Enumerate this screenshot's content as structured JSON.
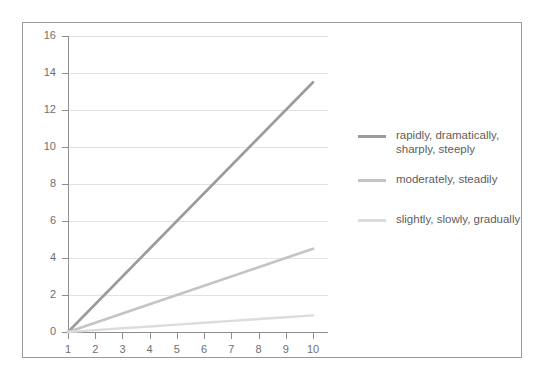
{
  "chart_data": {
    "type": "line",
    "title": "",
    "xlabel": "",
    "ylabel": "",
    "x": [
      1,
      2,
      3,
      4,
      5,
      6,
      7,
      8,
      9,
      10
    ],
    "xlim": [
      1,
      10
    ],
    "ylim": [
      0,
      16
    ],
    "ytick_labels": [
      "0",
      "2",
      "4",
      "6",
      "8",
      "10",
      "12",
      "14",
      "16"
    ],
    "yticks": [
      0,
      2,
      4,
      6,
      8,
      10,
      12,
      14,
      16
    ],
    "xtick_labels": [
      "1",
      "2",
      "3",
      "4",
      "5",
      "6",
      "7",
      "8",
      "9",
      "10"
    ],
    "grid": "horizontal",
    "legend_position": "right",
    "series": [
      {
        "name": "rapidly, dramatically, sharply, steeply",
        "color": "#9b9b9b",
        "values": [
          0,
          1.5,
          3.0,
          4.5,
          6.0,
          7.5,
          9.0,
          10.5,
          12.0,
          13.5
        ]
      },
      {
        "name": "moderately, steadily",
        "color": "#c4c4c4",
        "values": [
          0,
          0.5,
          1.0,
          1.5,
          2.0,
          2.5,
          3.0,
          3.5,
          4.0,
          4.5
        ]
      },
      {
        "name": "slightly, slowly, gradually",
        "color": "#dcdcdc",
        "values": [
          0,
          0.1,
          0.2,
          0.3,
          0.4,
          0.5,
          0.6,
          0.7,
          0.8,
          0.9
        ]
      }
    ]
  },
  "legend": {
    "items": [
      {
        "label_line1": "rapidly, dramatically,",
        "label_line2": "sharply, steeply",
        "color": "#9b9b9b"
      },
      {
        "label_line1": "moderately, steadily",
        "label_line2": "",
        "color": "#c4c4c4"
      },
      {
        "label_line1": "slightly, slowly, gradually",
        "label_line2": "",
        "color": "#dcdcdc"
      }
    ]
  },
  "axes": {
    "y_labels": [
      "16",
      "14",
      "12",
      "10",
      "8",
      "6",
      "4",
      "2",
      "0"
    ],
    "x_labels": [
      "1",
      "2",
      "3",
      "4",
      "5",
      "6",
      "7",
      "8",
      "9",
      "10"
    ]
  },
  "colors": {
    "frame": "#9a9a9a",
    "axis": "#8d8d8d",
    "grid": "#e2e2e2",
    "text": "#6f6f6f",
    "legend_text": "#5d5d5d",
    "background": "#ffffff"
  }
}
